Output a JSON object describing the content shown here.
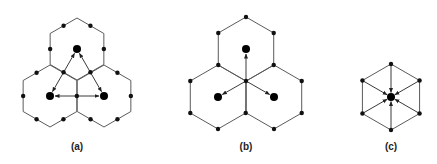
{
  "figure": {
    "panels": [
      {
        "id": "a",
        "label": "(a)",
        "center_vertex": [
          77,
          80
        ],
        "hex_radius": 31,
        "hex_centers": [
          [
            77,
            49
          ],
          [
            50,
            96
          ],
          [
            104,
            96
          ]
        ],
        "dots_at": "edge-midpoints",
        "big_nodes": [
          [
            77,
            49
          ],
          [
            50,
            96
          ],
          [
            104,
            96
          ]
        ],
        "arrows": "double-headed triangle between big nodes"
      },
      {
        "id": "b",
        "label": "(b)",
        "center_vertex": [
          246,
          81
        ],
        "hex_radius": 32,
        "hex_centers": [
          [
            246,
            49
          ],
          [
            218,
            97
          ],
          [
            274,
            97
          ]
        ],
        "dots_at": "vertices",
        "big_nodes": [
          [
            246,
            49
          ],
          [
            218,
            97
          ],
          [
            274,
            97
          ]
        ],
        "arrows": "from center vertex outward to big nodes"
      },
      {
        "id": "c",
        "label": "(c)",
        "center": [
          391,
          97
        ],
        "hex_radius": 33,
        "dots_at": "vertices",
        "big_nodes": [
          [
            391,
            97
          ]
        ],
        "arrows": "from six vertices inward to center"
      }
    ],
    "colors": {
      "line": "#5a5a5a",
      "node": "#000000"
    }
  }
}
